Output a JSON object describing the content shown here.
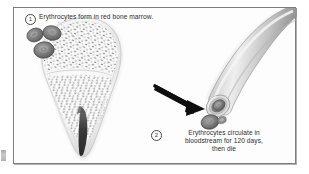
{
  "figure": {
    "style": "grayscale anatomical illustration",
    "frame_color": "#7e7e7e",
    "background_color": "#ffffff"
  },
  "callouts": [
    {
      "number": "1",
      "text": "Erythrocytes form in red bone marrow.",
      "leader": "dashed-line-to-marrow"
    },
    {
      "number": "2",
      "text": "Erythrocytes circulate in\nbloodstream for 120 days,\nthen die",
      "leader": "none"
    }
  ],
  "graphics": {
    "erythrocyte_cluster": {
      "name": "erythrocyte-cluster",
      "count": 3,
      "shape": "biconcave-disc",
      "rim_color": "#6e6e6e",
      "center_color": "#a8a8a8"
    },
    "bone": {
      "name": "long-bone-proximal-end",
      "regions": [
        "epiphysis",
        "epiphyseal-line",
        "spongy-bone-red-marrow",
        "medullary-cavity",
        "compact-bone-cortex"
      ],
      "marrow_speckle_color": "#8a8a8a",
      "cortex_color": "#d8d8d8",
      "cavity_color": "#3d3d3d"
    },
    "arrow": {
      "name": "flow-arrow",
      "direction": "down-right",
      "color": "#101010"
    },
    "blood_vessel": {
      "name": "blood-vessel",
      "shape": "curved-tube-cut-open",
      "wall_color": "#b3b3b3",
      "lumen_color": "#8f8f8f",
      "contained_cells": 2
    }
  }
}
